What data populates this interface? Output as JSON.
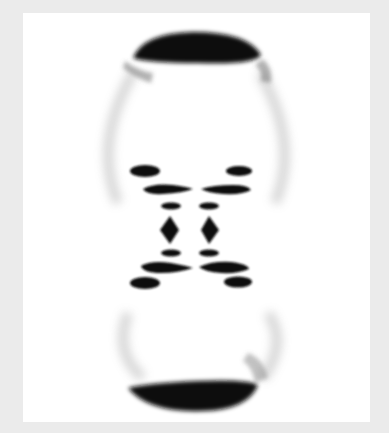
{
  "image": {
    "subject": "X-ray fiber diffraction pattern",
    "colors": {
      "frame": "#ebebeb",
      "panel": "#ffffff",
      "ink": "#111111",
      "haze": "#9a9a9a"
    }
  }
}
